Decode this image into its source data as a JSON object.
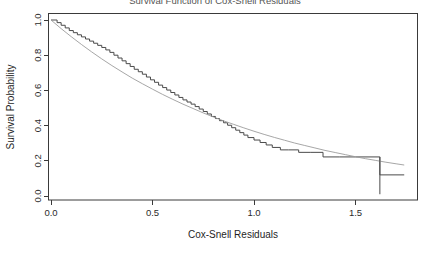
{
  "chart_data": {
    "type": "line",
    "title": "Survival Function of Cox-Snell Residuals",
    "xlabel": "Cox-Snell Residuals",
    "ylabel": "Survival Probability",
    "xlim": [
      0.0,
      1.74
    ],
    "ylim": [
      0.0,
      1.04
    ],
    "grid": false,
    "legend": "none",
    "xticks": [
      0.0,
      0.5,
      1.0,
      1.5
    ],
    "xtick_labels": [
      "0.0",
      "0.5",
      "1.0",
      "1.5"
    ],
    "yticks": [
      0.0,
      0.2,
      0.4,
      0.6,
      0.8,
      1.0
    ],
    "ytick_labels": [
      "0.0",
      "0.2",
      "0.4",
      "0.6",
      "0.8",
      "1.0"
    ],
    "series": [
      {
        "name": "Kaplan-Meier estimate of Cox-Snell residuals",
        "style": "step",
        "color": "#4a4a4a",
        "x": [
          0.0,
          0.03,
          0.05,
          0.07,
          0.09,
          0.11,
          0.13,
          0.15,
          0.17,
          0.19,
          0.21,
          0.23,
          0.25,
          0.27,
          0.29,
          0.31,
          0.33,
          0.35,
          0.37,
          0.39,
          0.41,
          0.43,
          0.45,
          0.47,
          0.49,
          0.51,
          0.53,
          0.55,
          0.57,
          0.59,
          0.61,
          0.63,
          0.65,
          0.67,
          0.69,
          0.71,
          0.73,
          0.75,
          0.77,
          0.79,
          0.81,
          0.83,
          0.85,
          0.87,
          0.89,
          0.91,
          0.93,
          0.95,
          0.97,
          1.0,
          1.03,
          1.06,
          1.09,
          1.13,
          1.17,
          1.22,
          1.28,
          1.34,
          1.42,
          1.5,
          1.62,
          1.74
        ],
        "y": [
          1.0,
          0.985,
          0.97,
          0.955,
          0.94,
          0.928,
          0.916,
          0.904,
          0.892,
          0.88,
          0.868,
          0.856,
          0.844,
          0.83,
          0.816,
          0.8,
          0.784,
          0.768,
          0.752,
          0.736,
          0.72,
          0.706,
          0.692,
          0.676,
          0.66,
          0.646,
          0.63,
          0.616,
          0.602,
          0.588,
          0.574,
          0.56,
          0.546,
          0.534,
          0.522,
          0.508,
          0.494,
          0.48,
          0.466,
          0.452,
          0.44,
          0.428,
          0.416,
          0.402,
          0.388,
          0.374,
          0.36,
          0.346,
          0.332,
          0.318,
          0.304,
          0.29,
          0.276,
          0.262,
          0.262,
          0.248,
          0.248,
          0.222,
          0.222,
          0.222,
          0.12,
          0.12
        ]
      },
      {
        "name": "Reference exponential survival curve",
        "style": "smooth",
        "color": "#9c9c9c",
        "x": [
          0.0,
          0.05,
          0.1,
          0.15,
          0.2,
          0.25,
          0.3,
          0.35,
          0.4,
          0.45,
          0.5,
          0.55,
          0.6,
          0.65,
          0.7,
          0.75,
          0.8,
          0.85,
          0.9,
          0.95,
          1.0,
          1.05,
          1.1,
          1.15,
          1.2,
          1.25,
          1.3,
          1.35,
          1.4,
          1.45,
          1.5,
          1.55,
          1.6,
          1.65,
          1.7,
          1.74
        ],
        "y": [
          1.0,
          0.951,
          0.905,
          0.861,
          0.819,
          0.779,
          0.741,
          0.705,
          0.67,
          0.638,
          0.607,
          0.577,
          0.549,
          0.522,
          0.497,
          0.472,
          0.449,
          0.427,
          0.407,
          0.387,
          0.368,
          0.35,
          0.333,
          0.317,
          0.301,
          0.287,
          0.273,
          0.259,
          0.247,
          0.235,
          0.223,
          0.212,
          0.202,
          0.192,
          0.183,
          0.176
        ]
      }
    ],
    "censor_marks": [
      {
        "x": 1.62,
        "y_top": 0.222,
        "y_bottom": 0.01
      }
    ]
  },
  "labels": {
    "title": "Survival Function of Cox-Snell Residuals",
    "xlabel": "Cox-Snell Residuals",
    "ylabel": "Survival Probability"
  }
}
